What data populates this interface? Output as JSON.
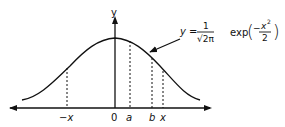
{
  "diagram": {
    "axis": {
      "y_label": "y",
      "origin_label": "0"
    },
    "x_labels": {
      "neg_x": "−x",
      "a": "a",
      "b": "b",
      "x": "x"
    },
    "formula": {
      "lhs": "y =",
      "numerator": "1",
      "denominator": "√2π",
      "func": "exp",
      "exp_sign": "−",
      "exp_num": "x",
      "exp_power": "2",
      "exp_den": "2"
    },
    "colors": {
      "ink": "#111111",
      "background": "#ffffff"
    }
  }
}
